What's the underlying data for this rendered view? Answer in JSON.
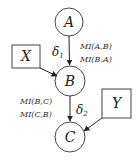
{
  "diagram": {
    "nodes": {
      "A": {
        "label": "A",
        "shape": "circle"
      },
      "B": {
        "label": "B",
        "shape": "circle"
      },
      "C": {
        "label": "C",
        "shape": "circle"
      },
      "X": {
        "label": "X",
        "shape": "box"
      },
      "Y": {
        "label": "Y",
        "shape": "box"
      }
    },
    "edges": {
      "a_to_b": {
        "from": "A",
        "to": "B",
        "delta": "δ",
        "delta_sub": "1",
        "labels": [
          "MI(A,B)",
          "MI(B,A)"
        ]
      },
      "b_to_c": {
        "from": "B",
        "to": "C",
        "delta": "δ",
        "delta_sub": "2",
        "labels": [
          "MI(B,C)",
          "MI(C,B)"
        ]
      },
      "x_to_b": {
        "from": "X",
        "to": "B"
      },
      "y_to_c": {
        "from": "Y",
        "to": "C"
      }
    },
    "colors": {
      "stroke": "#333333",
      "background": "#ffffff"
    }
  }
}
